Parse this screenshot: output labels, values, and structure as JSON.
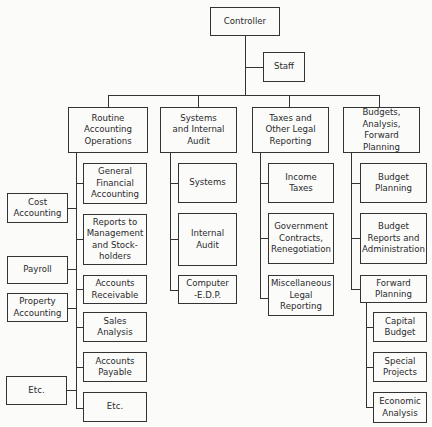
{
  "chart": {
    "root": {
      "label": "Controller"
    },
    "staff": {
      "label": "Staff"
    },
    "departments": [
      {
        "label": "Routine\nAccounting\nOperations",
        "children": [
          {
            "label": "General\nFinancial\nAccounting"
          },
          {
            "label": "Reports to\nManagement\nand Stock-\nholders"
          },
          {
            "label": "Accounts\nReceivable"
          },
          {
            "label": "Sales\nAnalysis"
          },
          {
            "label": "Accounts\nPayable"
          },
          {
            "label": "Etc."
          }
        ],
        "side_units": [
          {
            "label": "Cost\nAccounting"
          },
          {
            "label": "Payroll"
          },
          {
            "label": "Property\nAccounting"
          },
          {
            "label": "Etc."
          }
        ]
      },
      {
        "label": "Systems\nand Internal\nAudit",
        "children": [
          {
            "label": "Systems"
          },
          {
            "label": "Internal\nAudit"
          },
          {
            "label": "Computer\n-E.D.P."
          }
        ]
      },
      {
        "label": "Taxes and\nOther Legal\nReporting",
        "children": [
          {
            "label": "Income\nTaxes"
          },
          {
            "label": "Government\nContracts,\nRenegotiation"
          },
          {
            "label": "Miscellaneous\nLegal\nReporting"
          }
        ]
      },
      {
        "label": "Budgets, Analysis,\nForward\nPlanning",
        "children": [
          {
            "label": "Budget\nPlanning"
          },
          {
            "label": "Budget\nReports and\nAdministration"
          },
          {
            "label": "Forward\nPlanning",
            "children": [
              {
                "label": "Capital\nBudget"
              },
              {
                "label": "Special\nProjects"
              },
              {
                "label": "Economic\nAnalysis"
              }
            ]
          }
        ]
      }
    ]
  }
}
